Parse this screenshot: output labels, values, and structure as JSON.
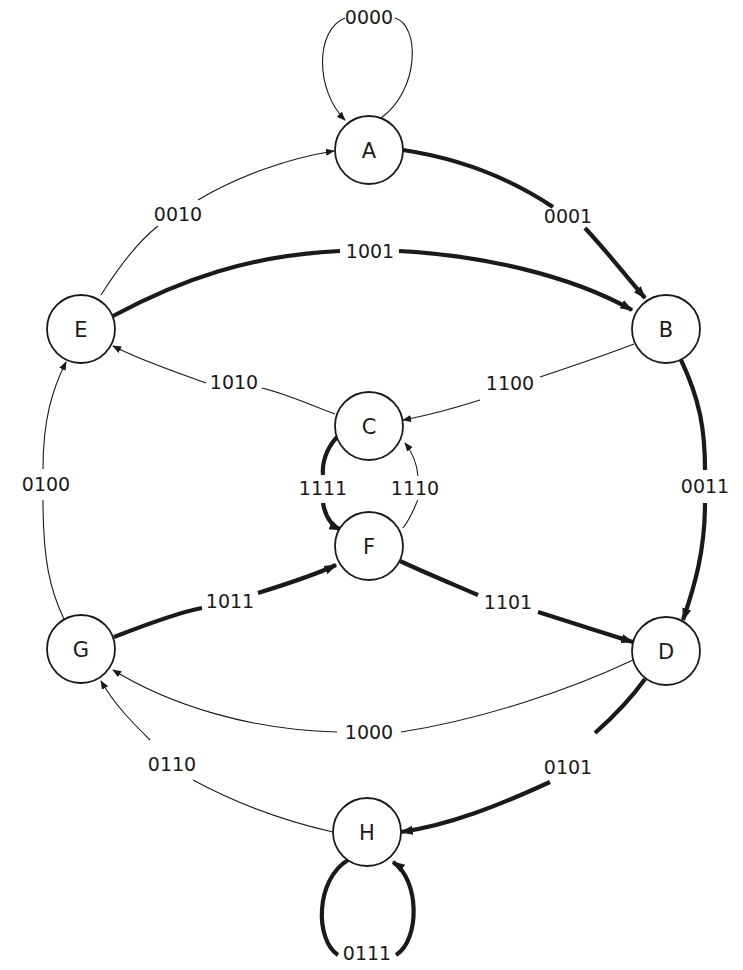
{
  "diagram": {
    "type": "state-transition",
    "node_radius": 34,
    "nodes": [
      {
        "id": "A",
        "label": "A",
        "x": 369,
        "y": 150
      },
      {
        "id": "B",
        "label": "B",
        "x": 666,
        "y": 329
      },
      {
        "id": "C",
        "label": "C",
        "x": 369,
        "y": 426
      },
      {
        "id": "D",
        "label": "D",
        "x": 666,
        "y": 651
      },
      {
        "id": "E",
        "label": "E",
        "x": 81,
        "y": 329
      },
      {
        "id": "F",
        "label": "F",
        "x": 369,
        "y": 546
      },
      {
        "id": "G",
        "label": "G",
        "x": 81,
        "y": 649
      },
      {
        "id": "H",
        "label": "H",
        "x": 367,
        "y": 832
      }
    ],
    "edges": [
      {
        "from": "A",
        "to": "A",
        "label": "0000",
        "weight": "thin",
        "path": "M 381 118 C 420 90, 420 25, 395 18 M 345 18 C 315 30, 315 90, 345 120",
        "label_x": 369,
        "label_y": 17
      },
      {
        "from": "A",
        "to": "B",
        "label": "0001",
        "weight": "thick",
        "path": "M 403 150 C 470 160, 520 185, 553 207 M 585 228 C 610 255, 625 275, 645 298",
        "label_x": 568,
        "label_y": 216
      },
      {
        "from": "E",
        "to": "A",
        "label": "0010",
        "weight": "thin",
        "path": "M 101 295 C 120 265, 140 240, 158 226 M 198 200 C 240 175, 290 158, 334 151",
        "label_x": 178,
        "label_y": 214
      },
      {
        "from": "B",
        "to": "D",
        "label": "0011",
        "weight": "thick",
        "path": "M 681 360 C 700 400, 705 430, 705 470 M 705 503 C 705 550, 695 585, 683 620",
        "label_x": 705,
        "label_y": 486
      },
      {
        "from": "G",
        "to": "E",
        "label": "0100",
        "weight": "thin",
        "path": "M 64 619 C 50 590, 43 560, 43 500 M 43 469 C 43 420, 52 390, 66 362",
        "label_x": 46,
        "label_y": 484
      },
      {
        "from": "D",
        "to": "H",
        "label": "0101",
        "weight": "thick",
        "path": "M 645 679 C 630 700, 612 718, 595 733 M 550 782 C 500 805, 450 825, 401 832",
        "label_x": 568,
        "label_y": 767
      },
      {
        "from": "H",
        "to": "G",
        "label": "0110",
        "weight": "thin",
        "path": "M 333 832 C 280 820, 230 800, 193 780 M 150 740 C 130 720, 115 705, 101 681",
        "label_x": 172,
        "label_y": 764
      },
      {
        "from": "H",
        "to": "H",
        "label": "0111",
        "weight": "thick",
        "path": "M 348 860 C 315 880, 315 940, 338 955 M 396 955 C 420 940, 420 880, 393 862",
        "label_x": 367,
        "label_y": 953
      },
      {
        "from": "D",
        "to": "G",
        "label": "1000",
        "weight": "thin",
        "path": "M 633 660 C 570 690, 480 720, 401 732 M 337 732 C 250 730, 170 705, 113 670",
        "label_x": 369,
        "label_y": 732
      },
      {
        "from": "E",
        "to": "B",
        "label": "1001",
        "weight": "thick",
        "path": "M 113 316 C 180 280, 250 255, 340 251 M 399 251 C 480 255, 570 275, 632 310",
        "label_x": 370,
        "label_y": 251
      },
      {
        "from": "C",
        "to": "E",
        "label": "1010",
        "weight": "thin",
        "path": "M 335 414 C 310 405, 290 395, 262 388 M 206 383 C 170 370, 140 360, 113 346",
        "label_x": 234,
        "label_y": 382
      },
      {
        "from": "F",
        "to": "D",
        "label": "1101",
        "weight": "thick",
        "path": "M 400 561 C 430 575, 455 585, 478 595 M 538 612 C 570 622, 600 632, 633 642",
        "label_x": 508,
        "label_y": 602
      },
      {
        "from": "B",
        "to": "C",
        "label": "1100",
        "weight": "thin",
        "path": "M 634 344 C 600 357, 570 367, 540 377 M 480 400 C 455 408, 430 415, 403 420",
        "label_x": 510,
        "label_y": 383
      },
      {
        "from": "G",
        "to": "F",
        "label": "1011",
        "weight": "thick",
        "path": "M 114 637 C 150 623, 180 612, 202 608 M 258 593 C 290 583, 315 575, 336 565",
        "label_x": 230,
        "label_y": 601
      },
      {
        "from": "C",
        "to": "F",
        "label": "1111",
        "weight": "thick",
        "path": "M 337 437 C 325 450, 322 465, 323 475 M 323 503 C 325 515, 330 525, 341 530",
        "label_x": 323,
        "label_y": 488
      },
      {
        "from": "F",
        "to": "C",
        "label": "1110",
        "weight": "thin",
        "path": "M 403 528 C 413 515, 417 500, 418 500 M 418 476 C 417 465, 412 452, 405 443",
        "label_x": 415,
        "label_y": 488
      }
    ]
  }
}
